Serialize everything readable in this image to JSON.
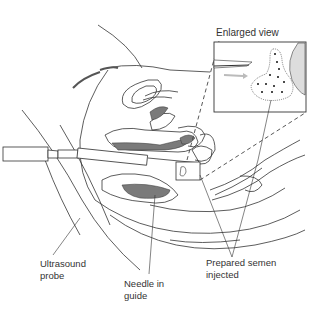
{
  "diagram": {
    "title_inset": "Enlarged view",
    "labels": {
      "ultrasound_probe": "Ultrasound\nprobe",
      "needle_in_guide": "Needle in\nguide",
      "prepared_semen": "Prepared semen\ninjected"
    },
    "colors": {
      "line": "#333333",
      "shading": "#7a7a7a",
      "dark": "#555555",
      "arrow": "#bbbbbb"
    }
  }
}
